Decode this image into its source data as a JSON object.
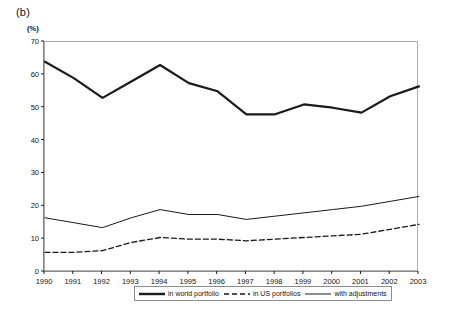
{
  "figure": {
    "panel_label": "(b)",
    "axis_unit_label": "(%)"
  },
  "legend": {
    "position": "bottom",
    "entries": [
      {
        "label": "in world portfolio",
        "style": "solid-thick",
        "color": "#1a1a1a"
      },
      {
        "label": "in US portfolios",
        "style": "dashed",
        "color": "#1a1a1a"
      },
      {
        "label": "with adjustments",
        "style": "solid-thin",
        "color": "#1a1a1a"
      }
    ]
  },
  "chart_data": {
    "type": "line",
    "title": "(b)",
    "xlabel": "",
    "ylabel": "(%)",
    "xlim": [
      1990,
      2003
    ],
    "ylim": [
      0,
      70
    ],
    "ytick_step": 10,
    "yticks": [
      "0",
      "10",
      "20",
      "30",
      "40",
      "50",
      "60",
      "70"
    ],
    "grid": false,
    "legend_position": "bottom",
    "x": [
      1990,
      1991,
      1992,
      1993,
      1994,
      1995,
      1996,
      1997,
      1998,
      1999,
      2000,
      2001,
      2002,
      2003
    ],
    "categories": [
      "1990",
      "1991",
      "1992",
      "1993",
      "1994",
      "1995",
      "1996",
      "1997",
      "1998",
      "1999",
      "2000",
      "2001",
      "2002",
      "2003"
    ],
    "series": [
      {
        "name": "with adjustments",
        "style": "solid-thick",
        "color": "#1a1a1a",
        "values": [
          64,
          59,
          53,
          58,
          63,
          57.5,
          55,
          48,
          48,
          51,
          50,
          48.5,
          53.5,
          56.5
        ]
      },
      {
        "name": "in world portfolio",
        "style": "solid-thin",
        "color": "#1a1a1a",
        "values": [
          16.5,
          15,
          13.5,
          16.5,
          19,
          17.5,
          17.5,
          16,
          17,
          18,
          19,
          20,
          21.5,
          23
        ]
      },
      {
        "name": "in US portfolios",
        "style": "dashed",
        "color": "#1a1a1a",
        "values": [
          6,
          6,
          6.5,
          9,
          10.5,
          10,
          10,
          9.5,
          10,
          10.5,
          11,
          11.5,
          13,
          14.5
        ]
      }
    ]
  }
}
